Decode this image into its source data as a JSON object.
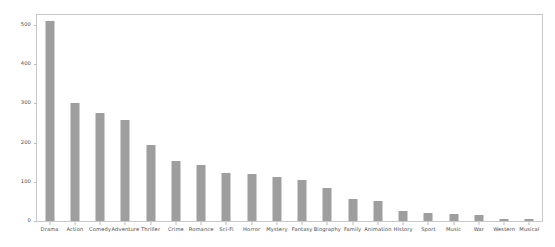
{
  "chart_data": {
    "type": "bar",
    "title": "",
    "subtitle": "",
    "xlabel": "",
    "ylabel": "",
    "grid": false,
    "legend": false,
    "legend_position": "none",
    "bar_color": "#9e9e9e",
    "axis_color": "#c9c9c9",
    "tick_label_color": "#4a4a4a",
    "background_color": "#ffffff",
    "ylim": [
      0,
      525
    ],
    "yticks": [
      0,
      100,
      200,
      300,
      400,
      500
    ],
    "ytick_labels": [
      "0",
      "100",
      "200",
      "300",
      "400",
      "500"
    ],
    "categories": [
      "Drama",
      "Action",
      "Comedy",
      "Adventure",
      "Thriller",
      "Crime",
      "Romance",
      "Sci-Fi",
      "Horror",
      "Mystery",
      "Fantasy",
      "Biography",
      "Family",
      "Animation",
      "History",
      "Sport",
      "Music",
      "War",
      "Western",
      "Musical"
    ],
    "values": [
      510,
      300,
      275,
      258,
      195,
      152,
      143,
      122,
      120,
      112,
      105,
      83,
      57,
      52,
      25,
      20,
      18,
      16,
      6,
      4
    ]
  }
}
